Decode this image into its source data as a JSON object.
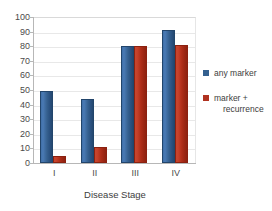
{
  "chart_data": {
    "type": "bar",
    "title": "",
    "categories": [
      "I",
      "II",
      "III",
      "IV"
    ],
    "series": [
      {
        "name": "any marker",
        "values": [
          49,
          44,
          80,
          91
        ],
        "color": "#34608f"
      },
      {
        "name": "marker + recurrence",
        "values": [
          5,
          11,
          80,
          81
        ],
        "color": "#b03220"
      }
    ],
    "xlabel": "Disease Stage",
    "ylabel": "",
    "ylim": [
      0,
      100
    ],
    "yticks": [
      0,
      10,
      20,
      30,
      40,
      50,
      60,
      70,
      80,
      90,
      100
    ],
    "grid": true,
    "legend_position": "right"
  },
  "axes": {
    "y_tick_labels": [
      "100",
      "90",
      "80",
      "70",
      "60",
      "50",
      "40",
      "30",
      "20",
      "10",
      "0"
    ],
    "x_tick_labels": [
      "I",
      "II",
      "III",
      "IV"
    ],
    "x_axis_title": "Disease Stage"
  },
  "legend": {
    "items": [
      {
        "label": "any marker",
        "label_line1": "any marker",
        "label_line2": "",
        "swatch": "legend-swatch-blue"
      },
      {
        "label": "marker + recurrence",
        "label_line1": "marker +",
        "label_line2": "recurrence",
        "swatch": "legend-swatch-red"
      }
    ]
  },
  "colors": {
    "series_blue": "#34608f",
    "series_red": "#b03220",
    "gridline": "#e8e8e8",
    "axis": "#b7b7b7",
    "text": "#3d3d3d",
    "background": "#ffffff"
  }
}
